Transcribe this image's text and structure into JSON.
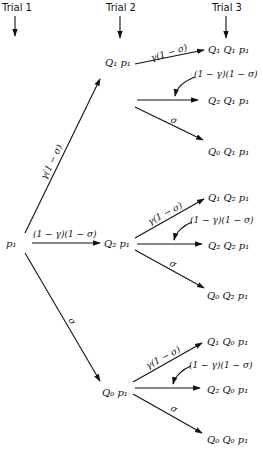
{
  "headers": {
    "trial1": "Trial 1",
    "trial2": "Trial 2",
    "trial3": "Trial 3"
  },
  "nodes": {
    "root": "p₁",
    "level1": {
      "q1": "Q₁ p₁",
      "q2": "Q₂ p₁",
      "q0": "Q₀ p₁"
    },
    "level2": {
      "q1q1": "Q₁ Q₁ p₁",
      "q2q1": "Q₂ Q₁ p₁",
      "q0q1": "Q₀ Q₁ p₁",
      "q1q2": "Q₁ Q₂ p₁",
      "q2q2": "Q₂ Q₂ p₁",
      "q0q2": "Q₀ Q₂ p₁",
      "q1q0": "Q₁ Q₀ p₁",
      "q2q0": "Q₂ Q₀ p₁",
      "q0q0": "Q₀ Q₀ p₁"
    }
  },
  "edge_labels": {
    "up": "γ(1 − σ)",
    "mid": "(1 − γ)(1 − σ)",
    "down": "σ"
  }
}
